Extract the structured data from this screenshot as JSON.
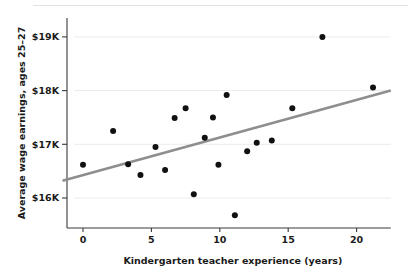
{
  "chart_data": {
    "type": "scatter",
    "title": "",
    "xlabel": "Kindergarten teacher experience (years)",
    "ylabel": "Average wage earnings, ages 25–27",
    "xlim": [
      -1.5,
      22.5
    ],
    "ylim": [
      15.35,
      19.35
    ],
    "grid": true,
    "legend": null,
    "xticks": [
      0,
      5,
      10,
      15,
      20
    ],
    "xtick_labels": [
      "0",
      "5",
      "10",
      "15",
      "20"
    ],
    "yticks": [
      16,
      17,
      18,
      19
    ],
    "ytick_labels": [
      "$16K",
      "$17K",
      "$18K",
      "$19K"
    ],
    "y_units": "thousands of dollars",
    "point_color": "#111111",
    "fit_line_color": "#8e8e8e",
    "grid_color": "#ebebeb",
    "axis_color": "#3a3a3a",
    "points": [
      {
        "x": 0.0,
        "y": 16.62
      },
      {
        "x": 2.2,
        "y": 17.25
      },
      {
        "x": 3.3,
        "y": 16.63
      },
      {
        "x": 4.2,
        "y": 16.43
      },
      {
        "x": 5.3,
        "y": 16.95
      },
      {
        "x": 6.0,
        "y": 16.52
      },
      {
        "x": 6.7,
        "y": 17.49
      },
      {
        "x": 7.5,
        "y": 17.67
      },
      {
        "x": 8.1,
        "y": 16.07
      },
      {
        "x": 8.9,
        "y": 17.12
      },
      {
        "x": 9.5,
        "y": 17.5
      },
      {
        "x": 9.9,
        "y": 16.62
      },
      {
        "x": 10.5,
        "y": 17.92
      },
      {
        "x": 11.1,
        "y": 15.68
      },
      {
        "x": 12.0,
        "y": 16.87
      },
      {
        "x": 12.7,
        "y": 17.03
      },
      {
        "x": 13.8,
        "y": 17.07
      },
      {
        "x": 15.3,
        "y": 17.67
      },
      {
        "x": 17.5,
        "y": 19.0
      },
      {
        "x": 21.2,
        "y": 18.06
      }
    ],
    "fit_line": {
      "x_start": -1.5,
      "y_start": 16.32,
      "x_end": 22.5,
      "y_end": 18.0
    }
  }
}
